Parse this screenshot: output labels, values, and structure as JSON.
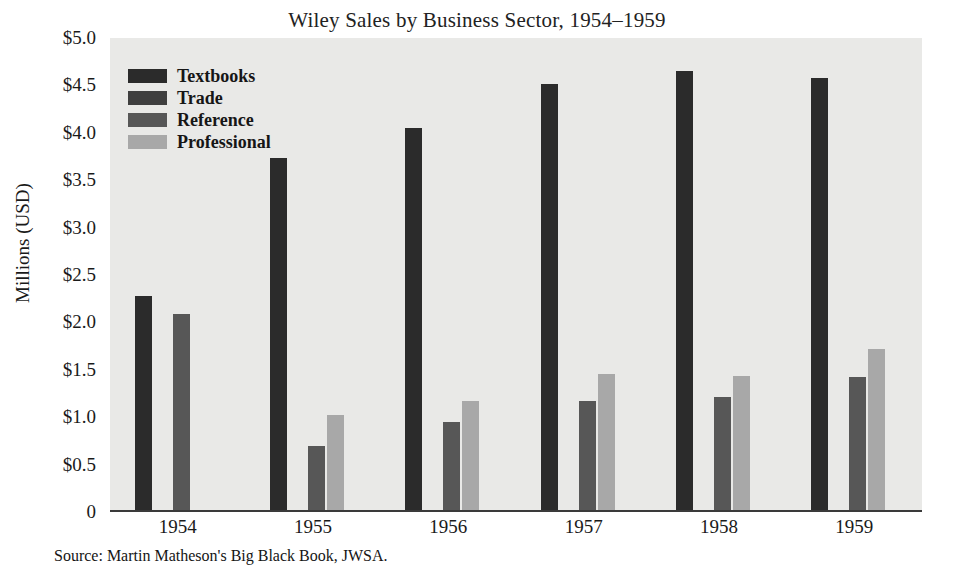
{
  "chart_data": {
    "type": "bar",
    "title": "Wiley Sales by Business Sector, 1954–1959",
    "xlabel": "",
    "ylabel": "Millions (USD)",
    "categories": [
      "1954",
      "1955",
      "1956",
      "1957",
      "1958",
      "1959"
    ],
    "ylim": [
      0,
      5.0
    ],
    "ytick_labels": [
      "$5.0",
      "$4.5",
      "$4.0",
      "$3.5",
      "$3.0",
      "$2.5",
      "$2.0",
      "$1.5",
      "$1.0",
      "$0.5",
      "0"
    ],
    "ytick_values": [
      5.0,
      4.5,
      4.0,
      3.5,
      3.0,
      2.5,
      2.0,
      1.5,
      1.0,
      0.5,
      0
    ],
    "grid": false,
    "legend_position": "top-left-inside",
    "series": [
      {
        "name": "Textbooks",
        "color": "#2b2b2b",
        "values": [
          2.28,
          3.73,
          4.05,
          4.52,
          4.65,
          4.58
        ]
      },
      {
        "name": "Trade",
        "color": "#3f3f3f",
        "values": [
          0.02,
          0.02,
          0.02,
          0.02,
          0.02,
          0.02
        ]
      },
      {
        "name": "Reference",
        "color": "#575757",
        "values": [
          2.09,
          0.7,
          0.95,
          1.17,
          1.21,
          1.42
        ]
      },
      {
        "name": "Professional",
        "color": "#a8a8a8",
        "values": [
          0.0,
          1.02,
          1.17,
          1.46,
          1.43,
          1.72
        ]
      }
    ],
    "source_note": "Source: Martin Matheson's Big Black Book, JWSA.",
    "plot_background": "#e9e9e7",
    "page_background": "#ffffff",
    "axis_color": "#3a3a3a"
  }
}
